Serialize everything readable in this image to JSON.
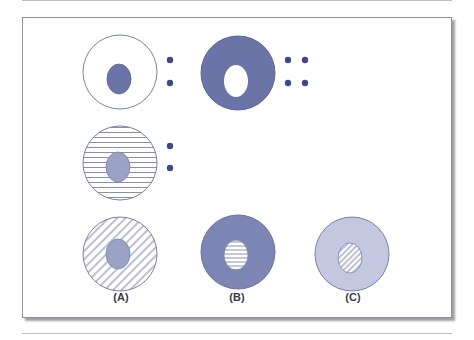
{
  "figure": {
    "colors": {
      "dark_fill": "#6a74a6",
      "medium_fill": "#7d86b3",
      "light_fill": "#c3c8e0",
      "inner_gray": "#9aa2c6",
      "outline": "#7c80a6",
      "dot": "#3d4a86",
      "stripe": "#8a8fb0"
    },
    "rows": [
      {
        "name": "row-1",
        "items": [
          {
            "name": "hollow-cell-small-nucleus",
            "outer": "white",
            "inner": "dark",
            "dots": 2
          },
          {
            "name": "dark-ring-white-center",
            "outer": "dark",
            "inner": "white",
            "dots": 4
          }
        ]
      },
      {
        "name": "row-2",
        "items": [
          {
            "name": "striped-cell-gray-nucleus",
            "outer": "horizontal-stripes",
            "inner": "gray",
            "dots": 2
          }
        ]
      },
      {
        "name": "row-3",
        "items": [
          {
            "name": "panel-a",
            "outer": "diagonal-hatch",
            "inner": "gray",
            "label": "(A)"
          },
          {
            "name": "panel-b",
            "outer": "dark",
            "inner": "horizontal-stripes",
            "label": "(B)"
          },
          {
            "name": "panel-c",
            "outer": "light",
            "inner": "diagonal-hatch",
            "label": "(C)"
          }
        ]
      }
    ],
    "labels": {
      "a": "(A)",
      "b": "(B)",
      "c": "(C)"
    }
  }
}
